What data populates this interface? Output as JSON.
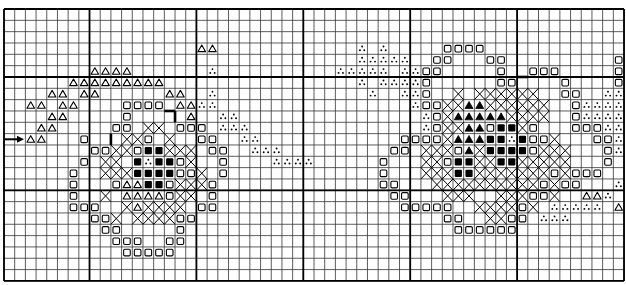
{
  "chart": {
    "title": "",
    "grid": {
      "origin_x": 4,
      "origin_y": 9,
      "cols": 58,
      "rows": 24,
      "cell_w": 10.69,
      "cell_h": 11.33,
      "major_col_lines": [
        0,
        8,
        18,
        28,
        38,
        48,
        58
      ],
      "major_row_lines": [
        0,
        6,
        16,
        24
      ],
      "line_color": "#000000",
      "minor_line_width": 0.8,
      "major_line_width": 1.8
    },
    "legend": {
      "T": "open-triangle",
      "A": "filled-triangle",
      "S": "open-square",
      "B": "filled-square",
      "X": "cross",
      "D": "three-dots"
    },
    "center_arrow": {
      "row": 11,
      "x_start": 5,
      "x_end": 24
    },
    "outline_segments": [
      {
        "r1": 9,
        "c1": 15,
        "r2": 9,
        "c2": 16
      },
      {
        "r1": 9,
        "c1": 16,
        "r2": 10,
        "c2": 16
      },
      {
        "r1": 11,
        "c1": 10,
        "r2": 12,
        "c2": 10
      },
      {
        "r1": 6,
        "c1": 48,
        "r2": 6,
        "c2": 49
      }
    ],
    "stitches": [
      {
        "row": 3,
        "T": [
          18,
          19
        ]
      },
      {
        "row": 5,
        "T": [
          8,
          9,
          10,
          11
        ],
        "D": [
          19
        ]
      },
      {
        "row": 6,
        "T": [
          6,
          7,
          8,
          9,
          10,
          11,
          12,
          13,
          14
        ]
      },
      {
        "row": 7,
        "T": [
          4,
          5,
          7,
          8,
          15,
          16
        ],
        "D": [
          19
        ]
      },
      {
        "row": 8,
        "T": [
          2,
          3,
          5,
          6,
          16,
          17
        ],
        "S": [
          11,
          12,
          13,
          14
        ],
        "D": [
          18,
          19
        ]
      },
      {
        "row": 9,
        "T": [
          4,
          5,
          17
        ],
        "S": [
          11
        ],
        "D": [
          20,
          21
        ]
      },
      {
        "row": 10,
        "T": [
          3,
          4
        ],
        "S": [
          10,
          11,
          16,
          17,
          18
        ],
        "X": [
          13,
          14
        ],
        "D": [
          20,
          21,
          22
        ]
      },
      {
        "row": 11,
        "T": [
          2,
          3
        ],
        "S": [
          7,
          13,
          18,
          19
        ],
        "X": [
          11,
          12,
          15
        ],
        "D": [
          22,
          23
        ]
      },
      {
        "row": 12,
        "S": [
          8,
          9,
          12,
          19,
          20
        ],
        "X": [
          10,
          11,
          15,
          16,
          17
        ],
        "B": [
          13,
          14
        ],
        "D": [
          23,
          24,
          25
        ]
      },
      {
        "row": 13,
        "S": [
          7,
          16,
          20
        ],
        "X": [
          9,
          10,
          17
        ],
        "B": [
          12,
          14,
          15
        ],
        "D": [
          13,
          25,
          26,
          27,
          28
        ]
      },
      {
        "row": 14,
        "S": [
          6,
          16,
          17,
          20
        ],
        "X": [
          9,
          10,
          11,
          18
        ],
        "B": [
          12,
          13,
          14,
          15
        ]
      },
      {
        "row": 15,
        "S": [
          6,
          10,
          15,
          19
        ],
        "T": [
          11,
          12
        ],
        "B": [
          13,
          14
        ],
        "X": [
          16,
          17,
          18
        ]
      },
      {
        "row": 16,
        "S": [
          6,
          15,
          19
        ],
        "X": [
          9,
          16,
          17
        ],
        "T": [
          11,
          12,
          13,
          14
        ]
      },
      {
        "row": 17,
        "S": [
          6,
          7,
          8,
          18,
          19
        ],
        "X": [
          11,
          13,
          14,
          15,
          16
        ],
        "T": [
          12
        ]
      },
      {
        "row": 18,
        "S": [
          8,
          9,
          16,
          17
        ],
        "X": [
          10,
          12,
          13,
          14,
          15
        ]
      },
      {
        "row": 19,
        "S": [
          9,
          10,
          16
        ]
      },
      {
        "row": 20,
        "S": [
          10,
          11,
          12,
          15,
          16
        ]
      },
      {
        "row": 21,
        "S": [
          11,
          12,
          13,
          14,
          15
        ]
      },
      {
        "row": 3,
        "D": [
          33,
          35
        ],
        "S": [
          41,
          42,
          43,
          44
        ]
      },
      {
        "row": 4,
        "D": [
          33,
          34,
          35,
          36,
          37
        ],
        "S": [
          40,
          41,
          45,
          46,
          57
        ]
      },
      {
        "row": 5,
        "D": [
          31,
          32,
          33,
          34,
          35,
          37,
          38
        ],
        "S": [
          39,
          40,
          46,
          49,
          50,
          51,
          57
        ]
      },
      {
        "row": 6,
        "D": [
          33,
          35,
          36,
          37,
          38
        ],
        "S": [
          39,
          46,
          47,
          52,
          57
        ]
      },
      {
        "row": 7,
        "D": [
          34,
          37,
          38,
          56,
          57
        ],
        "S": [
          39,
          52,
          53
        ],
        "X": [
          42,
          44,
          45,
          46,
          47,
          48,
          49
        ]
      },
      {
        "row": 8,
        "D": [
          38,
          54,
          55,
          56,
          57
        ],
        "S": [
          39,
          40,
          53
        ],
        "X": [
          41,
          42,
          45,
          46,
          47,
          48,
          49,
          50
        ],
        "A": [
          43,
          44
        ]
      },
      {
        "row": 9,
        "D": [
          39,
          54,
          55,
          56,
          57
        ],
        "S": [
          40,
          53
        ],
        "X": [
          41,
          47,
          48,
          49,
          50
        ],
        "A": [
          42,
          43,
          44,
          45,
          46
        ]
      },
      {
        "row": 10,
        "D": [
          39,
          56,
          57
        ],
        "S": [
          40,
          45,
          49,
          53,
          54,
          55
        ],
        "X": [
          41,
          42,
          48
        ],
        "A": [
          43,
          44
        ],
        "B": [
          46,
          47
        ]
      },
      {
        "row": 11,
        "S": [
          37,
          38,
          39,
          40,
          49,
          50,
          55,
          56
        ],
        "X": [
          41,
          51
        ],
        "A": [
          42,
          43,
          44
        ],
        "B": [
          45,
          46,
          48
        ],
        "D": [
          47,
          57
        ]
      },
      {
        "row": 12,
        "S": [
          36,
          37,
          42,
          49,
          56
        ],
        "X": [
          39,
          40,
          41,
          44,
          50,
          51,
          52
        ],
        "A": [
          43
        ],
        "B": [
          45,
          46,
          47,
          48
        ],
        "D": [
          57
        ]
      },
      {
        "row": 13,
        "S": [
          35,
          41,
          56
        ],
        "X": [
          39,
          40,
          44,
          45,
          48,
          49,
          50,
          51,
          52
        ],
        "B": [
          42,
          43,
          46,
          47
        ]
      },
      {
        "row": 14,
        "S": [
          35,
          51,
          53,
          54,
          55
        ],
        "X": [
          39,
          40,
          41,
          44,
          45,
          46,
          47,
          48,
          49,
          50,
          52
        ],
        "B": [
          42,
          43
        ]
      },
      {
        "row": 15,
        "S": [
          35,
          36,
          50,
          52,
          53
        ],
        "X": [
          40,
          41,
          42,
          43,
          44,
          45,
          46,
          47,
          48,
          49,
          51
        ],
        "D": [
          57
        ]
      },
      {
        "row": 16,
        "S": [
          36,
          37,
          49,
          50
        ],
        "X": [
          41,
          42,
          43,
          46,
          47,
          48,
          51
        ],
        "T": [
          54,
          55
        ],
        "D": [
          56
        ]
      },
      {
        "row": 17,
        "S": [
          37,
          38,
          39,
          40,
          41,
          48
        ],
        "X": [
          44,
          45,
          46,
          47,
          49
        ],
        "D": [
          51,
          52,
          53,
          54,
          55
        ],
        "T": [
          57
        ]
      },
      {
        "row": 18,
        "S": [
          41,
          42,
          47,
          48
        ],
        "X": [
          45,
          46
        ],
        "D": [
          50,
          51,
          52
        ]
      },
      {
        "row": 19,
        "S": [
          42,
          43,
          44,
          45,
          46,
          47
        ]
      }
    ]
  }
}
